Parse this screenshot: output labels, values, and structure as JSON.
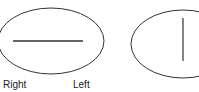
{
  "labels": {
    "right": "Right",
    "left": "Left"
  },
  "colors": {
    "stroke": "#333333",
    "text": "#222222",
    "background": "#ffffff"
  },
  "shapes": [
    {
      "type": "ellipse",
      "name": "left-ellipse",
      "cx": 51,
      "cy": 41,
      "rx": 53,
      "ry": 33
    },
    {
      "type": "line",
      "name": "horizontal-line",
      "x1": 13,
      "y1": 41,
      "x2": 83,
      "y2": 41
    },
    {
      "type": "ellipse",
      "name": "right-ellipse",
      "cx": 183,
      "cy": 44,
      "rx": 52,
      "ry": 34
    },
    {
      "type": "line",
      "name": "vertical-line",
      "x1": 183,
      "y1": 18,
      "x2": 183,
      "y2": 61
    }
  ]
}
